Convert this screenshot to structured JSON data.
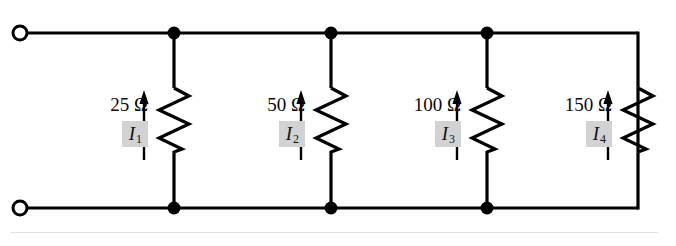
{
  "figure": {
    "background_color": "#ffffff",
    "wire_color": "#000000",
    "highlight_color": "#d2d2d2"
  },
  "terminals": [
    {
      "name": "top-left-terminal",
      "x": 20,
      "y": 33,
      "style": "open-circle"
    },
    {
      "name": "bottom-left-terminal",
      "x": 20,
      "y": 208,
      "style": "open-circle"
    }
  ],
  "rails": {
    "top": {
      "y": 33,
      "x_start": 20,
      "x_end": 638
    },
    "bottom": {
      "y": 208,
      "x_start": 20,
      "x_end": 638
    },
    "right": {
      "x": 638,
      "y_start": 33,
      "y_end": 208
    }
  },
  "junction_dots": [
    {
      "x": 174,
      "y": 33
    },
    {
      "x": 331,
      "y": 33
    },
    {
      "x": 487,
      "y": 33
    },
    {
      "x": 174,
      "y": 208
    },
    {
      "x": 331,
      "y": 208
    },
    {
      "x": 487,
      "y": 208
    }
  ],
  "branches": [
    {
      "id": "branch-1",
      "resistance": "25 Ω",
      "current": "I",
      "current_sub": "1",
      "branch_x": 174,
      "label_right_x": 148,
      "arrow_x": 144,
      "arrow_top": 93,
      "arrow_bottom": 160
    },
    {
      "id": "branch-2",
      "resistance": "50 Ω",
      "current": "I",
      "current_sub": "2",
      "branch_x": 331,
      "label_right_x": 305,
      "arrow_x": 301,
      "arrow_top": 93,
      "arrow_bottom": 160
    },
    {
      "id": "branch-3",
      "resistance": "100 Ω",
      "current": "I",
      "current_sub": "3",
      "branch_x": 487,
      "label_right_x": 461,
      "arrow_x": 457,
      "arrow_top": 93,
      "arrow_bottom": 160
    },
    {
      "id": "branch-4",
      "resistance": "150 Ω",
      "current": "I",
      "current_sub": "4",
      "branch_x": 638,
      "label_right_x": 612,
      "arrow_x": 608,
      "arrow_top": 93,
      "arrow_bottom": 160
    }
  ]
}
